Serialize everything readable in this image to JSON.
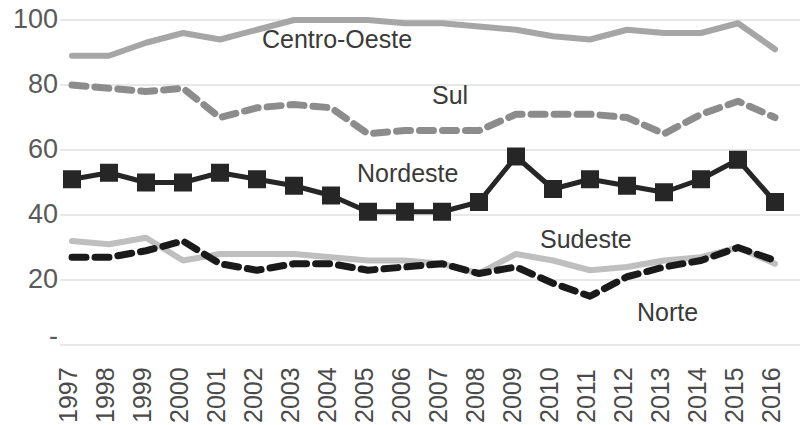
{
  "chart_data": {
    "type": "line",
    "title": "",
    "xlabel": "",
    "ylabel": "",
    "x": [
      1997,
      1998,
      1999,
      2000,
      2001,
      2002,
      2003,
      2004,
      2005,
      2006,
      2007,
      2008,
      2009,
      2010,
      2011,
      2012,
      2013,
      2014,
      2015,
      2016
    ],
    "categories": [
      "1997",
      "1998",
      "1999",
      "2000",
      "2001",
      "2002",
      "2003",
      "2004",
      "2005",
      "2006",
      "2007",
      "2008",
      "2009",
      "2010",
      "2011",
      "2012",
      "2013",
      "2014",
      "2015",
      "2016"
    ],
    "ylim": [
      0,
      100
    ],
    "yticks": [
      0,
      20,
      40,
      60,
      80,
      100
    ],
    "ytick_labels": [
      "-",
      "20",
      "40",
      "60",
      "80",
      "100"
    ],
    "grid": true,
    "grid_axis": "y",
    "legend": "inline-labels",
    "series": [
      {
        "name": "Centro-Oeste",
        "style": "solid",
        "color": "#a6a6a6",
        "marker": "none",
        "values": [
          89,
          89,
          93,
          96,
          94,
          97,
          100,
          100,
          100,
          99,
          99,
          98,
          97,
          95,
          94,
          97,
          96,
          96,
          99,
          91
        ]
      },
      {
        "name": "Sul",
        "style": "dashed",
        "color": "#8c8c8c",
        "marker": "none",
        "values": [
          80,
          79,
          78,
          79,
          70,
          73,
          74,
          73,
          65,
          66,
          66,
          66,
          71,
          71,
          71,
          70,
          65,
          71,
          75,
          70
        ]
      },
      {
        "name": "Nordeste",
        "style": "solid",
        "color": "#262626",
        "marker": "square",
        "values": [
          51,
          53,
          50,
          50,
          53,
          51,
          49,
          46,
          41,
          41,
          41,
          44,
          58,
          48,
          51,
          49,
          47,
          51,
          57,
          44
        ]
      },
      {
        "name": "Sudeste",
        "style": "solid",
        "color": "#bfbfbf",
        "marker": "none",
        "values": [
          32,
          31,
          33,
          26,
          28,
          28,
          28,
          27,
          26,
          26,
          25,
          22,
          28,
          26,
          23,
          24,
          26,
          27,
          30,
          25
        ]
      },
      {
        "name": "Norte",
        "style": "dashed",
        "color": "#1a1a1a",
        "marker": "none",
        "values": [
          27,
          27,
          29,
          32,
          25,
          23,
          25,
          25,
          23,
          24,
          25,
          22,
          24,
          19,
          15,
          21,
          24,
          26,
          30,
          26
        ]
      }
    ],
    "series_label_positions": [
      {
        "name": "Centro-Oeste",
        "left": 262,
        "top": 27
      },
      {
        "name": "Sul",
        "left": 432,
        "top": 83
      },
      {
        "name": "Nordeste",
        "left": 357,
        "top": 161
      },
      {
        "name": "Sudeste",
        "left": 540,
        "top": 227
      },
      {
        "name": "Norte",
        "left": 637,
        "top": 300
      }
    ],
    "colors": {
      "grid": "#e0e0e0",
      "background": "#ffffff",
      "axis_text": "#5a5a5a"
    }
  }
}
